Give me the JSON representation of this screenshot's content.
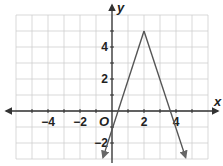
{
  "chart_data": {
    "type": "line",
    "title": "",
    "xlabel": "x",
    "ylabel": "y",
    "origin_label": "O",
    "xlim": [
      -6,
      6
    ],
    "ylim": [
      -3,
      6
    ],
    "grid": true,
    "x_ticks": [
      -4,
      -2,
      2,
      4
    ],
    "x_tick_labels": [
      "−4",
      "−2",
      "2",
      "4"
    ],
    "y_ticks": [
      -2,
      2,
      4
    ],
    "y_tick_labels": [
      "−2",
      "2",
      "4"
    ],
    "series": [
      {
        "name": "absolute-value-style graph",
        "points": [
          [
            -0.56,
            -2.9
          ],
          [
            2,
            5
          ],
          [
            4.6,
            -2.9
          ]
        ],
        "vertex": [
          2,
          5
        ],
        "left_branch": "y = 3x - 1",
        "right_branch": "y = -3x + 11",
        "arrows_at_ends": true,
        "color": "#555555"
      }
    ]
  }
}
